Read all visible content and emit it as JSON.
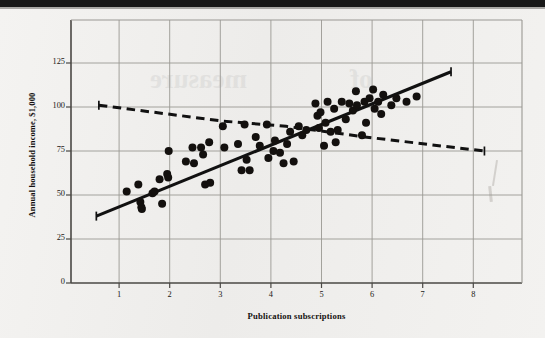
{
  "figure": {
    "type": "scatter-plot",
    "media": "scanned-textbook-page"
  },
  "axes": {
    "x_title": "Publication subscriptions",
    "y_title": "Annual household income, $1,000",
    "x_ticks": [
      "1",
      "2",
      "3",
      "4",
      "5",
      "6",
      "7",
      "8"
    ],
    "y_ticks": [
      "0",
      "25",
      "50",
      "75",
      "100",
      "125"
    ]
  },
  "chart_data": {
    "type": "scatter",
    "title": "",
    "xlabel": "Publication subscriptions",
    "ylabel": "Annual household income, $1,000",
    "xlim": [
      0.25,
      8.95
    ],
    "ylim": [
      0,
      140
    ],
    "x_ticks": [
      1,
      2,
      3,
      4,
      5,
      6,
      7,
      8
    ],
    "y_ticks": [
      0,
      25,
      50,
      75,
      100,
      125
    ],
    "grid": true,
    "legend": "none",
    "series": [
      {
        "name": "observations",
        "marker": "filled-circle",
        "color": "#13100e",
        "points": [
          [
            1.15,
            52
          ],
          [
            1.38,
            56
          ],
          [
            1.42,
            46
          ],
          [
            1.44,
            43
          ],
          [
            1.45,
            42
          ],
          [
            1.66,
            51
          ],
          [
            1.7,
            52
          ],
          [
            1.8,
            59
          ],
          [
            1.85,
            45
          ],
          [
            1.95,
            62
          ],
          [
            1.97,
            60
          ],
          [
            1.98,
            75
          ],
          [
            2.32,
            69
          ],
          [
            2.45,
            77
          ],
          [
            2.48,
            68
          ],
          [
            2.62,
            77
          ],
          [
            2.66,
            73
          ],
          [
            2.7,
            56
          ],
          [
            2.78,
            80
          ],
          [
            2.8,
            57
          ],
          [
            3.05,
            89
          ],
          [
            3.08,
            77
          ],
          [
            3.35,
            79
          ],
          [
            3.42,
            64
          ],
          [
            3.48,
            90
          ],
          [
            3.52,
            70
          ],
          [
            3.58,
            64
          ],
          [
            3.7,
            83
          ],
          [
            3.78,
            78
          ],
          [
            3.92,
            90
          ],
          [
            3.95,
            71
          ],
          [
            4.05,
            75
          ],
          [
            4.08,
            81
          ],
          [
            4.18,
            74
          ],
          [
            4.25,
            68
          ],
          [
            4.32,
            79
          ],
          [
            4.38,
            86
          ],
          [
            4.45,
            69
          ],
          [
            4.55,
            89
          ],
          [
            4.62,
            84
          ],
          [
            4.7,
            87
          ],
          [
            4.88,
            102
          ],
          [
            4.92,
            95
          ],
          [
            4.95,
            88
          ],
          [
            4.98,
            97
          ],
          [
            5.05,
            78
          ],
          [
            5.08,
            91
          ],
          [
            5.12,
            103
          ],
          [
            5.18,
            86
          ],
          [
            5.25,
            99
          ],
          [
            5.28,
            80
          ],
          [
            5.32,
            87
          ],
          [
            5.4,
            103
          ],
          [
            5.48,
            93
          ],
          [
            5.55,
            102
          ],
          [
            5.62,
            98
          ],
          [
            5.68,
            109
          ],
          [
            5.7,
            101
          ],
          [
            5.8,
            84
          ],
          [
            5.85,
            103
          ],
          [
            5.88,
            91
          ],
          [
            5.95,
            105
          ],
          [
            6.02,
            110
          ],
          [
            6.05,
            99
          ],
          [
            6.12,
            103
          ],
          [
            6.18,
            96
          ],
          [
            6.22,
            107
          ],
          [
            6.38,
            101
          ],
          [
            6.48,
            105
          ],
          [
            6.68,
            103
          ],
          [
            6.88,
            106
          ]
        ]
      }
    ],
    "lines": [
      {
        "name": "solid-regression-line",
        "style": "solid",
        "color": "#111111",
        "points": [
          [
            0.55,
            38
          ],
          [
            7.56,
            120
          ]
        ]
      },
      {
        "name": "dashed-line",
        "style": "dashed",
        "color": "#111111",
        "points": [
          [
            0.6,
            101
          ],
          [
            3.05,
            92
          ],
          [
            4.3,
            89
          ],
          [
            5.85,
            83
          ],
          [
            8.22,
            75
          ]
        ]
      }
    ]
  },
  "ghost_text": {
    "line1": "measure",
    "line2": "of"
  }
}
